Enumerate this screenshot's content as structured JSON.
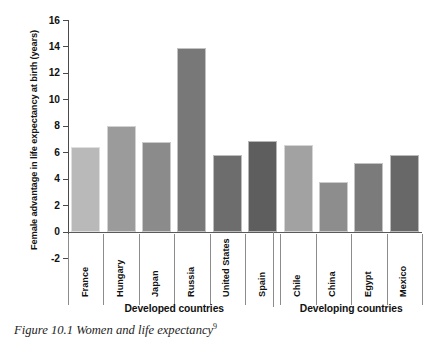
{
  "caption": {
    "text": "Figure 10.1 Women and life expectancy",
    "footnote_marker": "9"
  },
  "chart_data": {
    "type": "bar",
    "title": "",
    "xlabel": "",
    "ylabel": "Female advantage in life expectancy at birth (years)",
    "ylim": [
      -2,
      16
    ],
    "ytick_step": 2,
    "yticks": [
      16,
      14,
      12,
      10,
      8,
      6,
      4,
      2,
      0,
      -2
    ],
    "ytick_labels": [
      "16",
      "14",
      "12",
      "10",
      "8",
      "6",
      "4",
      "2",
      "0",
      "-2"
    ],
    "grid": false,
    "legend": "none",
    "categories": [
      "France",
      "Hungary",
      "Japan",
      "Russia",
      "United States",
      "Spain",
      "Chile",
      "China",
      "Egypt",
      "Mexico"
    ],
    "values": [
      6.4,
      8.0,
      6.8,
      13.9,
      5.8,
      6.9,
      6.6,
      3.8,
      5.2,
      5.8
    ],
    "bar_colors": [
      "#b9b9b9",
      "#9b9b9b",
      "#8b8b8b",
      "#787878",
      "#6d6d6d",
      "#5e5e5e",
      "#a2a2a2",
      "#8d8d8d",
      "#7b7b7b",
      "#686868"
    ],
    "groups": [
      {
        "label": "Developed countries",
        "categories": [
          "France",
          "Hungary",
          "Japan",
          "Russia",
          "United States",
          "Spain"
        ]
      },
      {
        "label": "Developing countries",
        "categories": [
          "Chile",
          "China",
          "Egypt",
          "Mexico"
        ]
      }
    ]
  }
}
